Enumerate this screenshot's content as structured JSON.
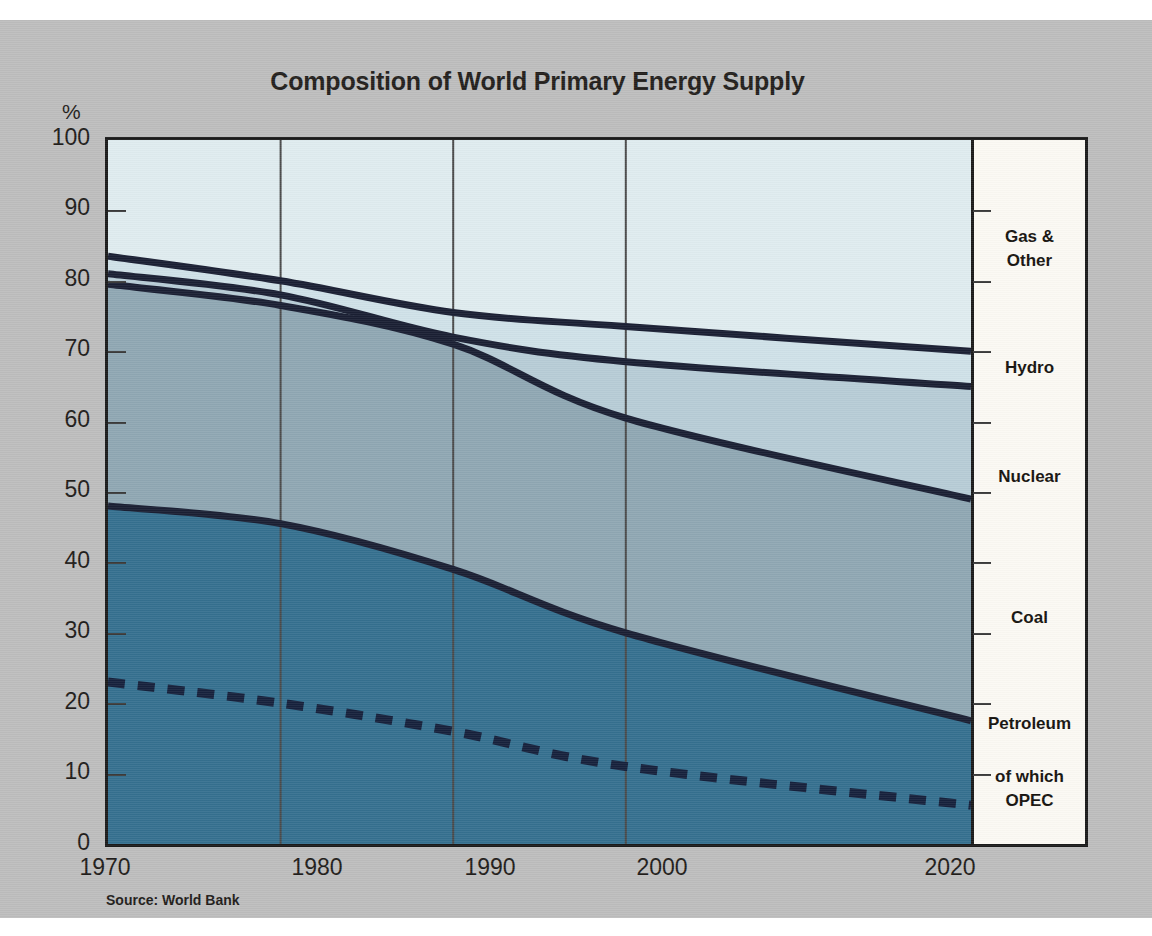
{
  "chart_data": {
    "type": "area",
    "title": "Composition of World Primary Energy Supply",
    "subtitle": "",
    "xlabel": "",
    "ylabel": "%",
    "source": "Source: World Bank",
    "x": [
      1970,
      1980,
      1990,
      2000,
      2020
    ],
    "xtick_labels": [
      "1970",
      "1980",
      "1990",
      "2000",
      "2020"
    ],
    "ytick_labels": [
      "0",
      "10",
      "20",
      "30",
      "40",
      "50",
      "60",
      "70",
      "80",
      "90",
      "100"
    ],
    "ylim": [
      0,
      100
    ],
    "xlim": [
      1970,
      2020
    ],
    "grid": "vertical",
    "legend_position": "right-panel",
    "stacked_cumulative_tops": {
      "petroleum": [
        48,
        45.5,
        39,
        30,
        17.5
      ],
      "coal": [
        79.5,
        76.5,
        71,
        60.5,
        49
      ],
      "nuclear": [
        81,
        78,
        72,
        68.5,
        65
      ],
      "hydro": [
        83.5,
        80,
        75.5,
        73.5,
        70
      ]
    },
    "series": [
      {
        "name": "Petroleum",
        "legend_label": "Petroleum",
        "color": "#35708f",
        "cumulative_top": [
          48,
          45.5,
          39,
          30,
          17.5
        ],
        "values": [
          48,
          45.5,
          39,
          30,
          17.5
        ]
      },
      {
        "name": "Coal",
        "legend_label": "Coal",
        "color": "#8fa7b3",
        "cumulative_top": [
          79.5,
          76.5,
          71,
          60.5,
          49
        ],
        "values": [
          31.5,
          31,
          32,
          30.5,
          31.5
        ]
      },
      {
        "name": "Nuclear",
        "legend_label": "Nuclear",
        "color": "#b7ccd6",
        "cumulative_top": [
          81,
          78,
          72,
          68.5,
          65
        ],
        "values": [
          1.5,
          1.5,
          1,
          8,
          16
        ]
      },
      {
        "name": "Hydro",
        "legend_label": "Hydro",
        "color": "#cfe1e8",
        "cumulative_top": [
          83.5,
          80,
          75.5,
          73.5,
          70
        ],
        "values": [
          2.5,
          2,
          3.5,
          5,
          5
        ]
      },
      {
        "name": "Gas & Other",
        "legend_label": "Gas & Other",
        "color": "#dfecef",
        "cumulative_top": [
          100,
          100,
          100,
          100,
          100
        ],
        "values": [
          16.5,
          20,
          24.5,
          26.5,
          30
        ]
      },
      {
        "name": "of which OPEC",
        "legend_label": "of which OPEC",
        "color": "#16213c",
        "style": "dashed",
        "values": [
          23,
          20,
          16,
          11,
          5.5
        ]
      }
    ],
    "legend_entries": [
      {
        "label_line1": "Gas &",
        "label_line2": "Other"
      },
      {
        "label_line1": "Hydro",
        "label_line2": ""
      },
      {
        "label_line1": "Nuclear",
        "label_line2": ""
      },
      {
        "label_line1": "Coal",
        "label_line2": ""
      },
      {
        "label_line1": "Petroleum",
        "label_line2": ""
      },
      {
        "label_line1": "of which",
        "label_line2": "OPEC"
      }
    ]
  },
  "colors": {
    "background": "#bdbdbd",
    "frame": "#1b1b1b",
    "line": "#1a1f33",
    "legend_bg": "#fbf9f3",
    "text": "#1f1c1a"
  }
}
